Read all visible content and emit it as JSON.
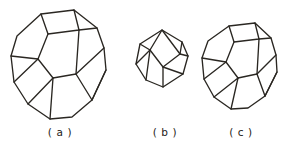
{
  "figure": {
    "background_color": "#ffffff",
    "line_color": "#2a2722",
    "line_width": 1.35,
    "panels": [
      {
        "id": "a",
        "caption": "( a )",
        "shape_name": "truncated-octahedron",
        "relative_size": "large",
        "visible_faces": [
          "square-top",
          "square-center",
          "hexagon-upper-left",
          "hexagon-upper-right",
          "hexagon-left",
          "hexagon-lower-left",
          "hexagon-lower-right",
          "square-right",
          "square-bottom"
        ],
        "outline": [
          [
            41,
            14
          ],
          [
            74,
            10
          ],
          [
            97,
            28
          ],
          [
            104,
            48
          ],
          [
            106,
            70
          ],
          [
            92,
            100
          ],
          [
            72,
            117
          ],
          [
            50,
            119
          ],
          [
            28,
            104
          ],
          [
            14,
            82
          ],
          [
            11,
            56
          ],
          [
            17,
            36
          ],
          [
            28,
            22
          ]
        ],
        "interior_edges": [
          [
            [
              41,
              14
            ],
            [
              48,
              34
            ],
            [
              79,
              30
            ],
            [
              74,
              10
            ]
          ],
          [
            [
              48,
              34
            ],
            [
              38,
              59
            ],
            [
              53,
              78
            ],
            [
              76,
              74
            ],
            [
              79,
              30
            ]
          ],
          [
            [
              79,
              30
            ],
            [
              97,
              28
            ]
          ],
          [
            [
              38,
              59
            ],
            [
              14,
              82
            ]
          ],
          [
            [
              53,
              78
            ],
            [
              50,
              119
            ]
          ],
          [
            [
              76,
              74
            ],
            [
              92,
              100
            ]
          ],
          [
            [
              38,
              59
            ],
            [
              11,
              56
            ]
          ],
          [
            [
              76,
              74
            ],
            [
              104,
              48
            ]
          ],
          [
            [
              106,
              70
            ],
            [
              92,
              100
            ]
          ],
          [
            [
              28,
              104
            ],
            [
              53,
              78
            ]
          ]
        ]
      },
      {
        "id": "b",
        "caption": "( b )",
        "shape_name": "rhombic-polyhedron",
        "relative_size": "small",
        "visible_faces": [
          "rhombus-front",
          "rhombus-upper-left",
          "rhombus-lower-left",
          "rhombus-right",
          "rhombus-top"
        ],
        "outline": [
          [
            162,
            30
          ],
          [
            182,
            42
          ],
          [
            188,
            56
          ],
          [
            183,
            74
          ],
          [
            163,
            87
          ],
          [
            146,
            80
          ],
          [
            136,
            64
          ],
          [
            140,
            44
          ]
        ],
        "interior_edges": [
          [
            [
              162,
              30
            ],
            [
              150,
              50
            ],
            [
              163,
              67
            ],
            [
              180,
              54
            ],
            [
              162,
              30
            ]
          ],
          [
            [
              150,
              50
            ],
            [
              140,
              44
            ]
          ],
          [
            [
              150,
              50
            ],
            [
              146,
              80
            ]
          ],
          [
            [
              163,
              67
            ],
            [
              163,
              87
            ]
          ],
          [
            [
              180,
              54
            ],
            [
              188,
              56
            ]
          ],
          [
            [
              180,
              54
            ],
            [
              182,
              42
            ]
          ],
          [
            [
              136,
              64
            ],
            [
              150,
              50
            ]
          ],
          [
            [
              183,
              74
            ],
            [
              163,
              67
            ]
          ]
        ]
      },
      {
        "id": "c",
        "caption": "( c )",
        "shape_name": "truncated-octahedron",
        "relative_size": "medium",
        "visible_faces": [
          "square-top",
          "square-center",
          "hexagon-upper-left",
          "hexagon-upper-right",
          "hexagon-left",
          "hexagon-lower-left",
          "hexagon-lower-right",
          "square-right",
          "square-bottom"
        ],
        "outline": [
          [
            229,
            26
          ],
          [
            255,
            23
          ],
          [
            271,
            38
          ],
          [
            276,
            55
          ],
          [
            277,
            72
          ],
          [
            265,
            96
          ],
          [
            248,
            108
          ],
          [
            231,
            109
          ],
          [
            214,
            97
          ],
          [
            204,
            79
          ],
          [
            202,
            58
          ],
          [
            208,
            41
          ],
          [
            217,
            32
          ]
        ],
        "interior_edges": [
          [
            [
              229,
              26
            ],
            [
              234,
              42
            ],
            [
              259,
              39
            ],
            [
              255,
              23
            ]
          ],
          [
            [
              234,
              42
            ],
            [
              226,
              62
            ],
            [
              238,
              78
            ],
            [
              257,
              74
            ],
            [
              259,
              39
            ]
          ],
          [
            [
              259,
              39
            ],
            [
              271,
              38
            ]
          ],
          [
            [
              226,
              62
            ],
            [
              204,
              79
            ]
          ],
          [
            [
              238,
              78
            ],
            [
              231,
              109
            ]
          ],
          [
            [
              257,
              74
            ],
            [
              265,
              96
            ]
          ],
          [
            [
              226,
              62
            ],
            [
              202,
              58
            ]
          ],
          [
            [
              257,
              74
            ],
            [
              276,
              55
            ]
          ],
          [
            [
              277,
              72
            ],
            [
              265,
              96
            ]
          ],
          [
            [
              214,
              97
            ],
            [
              238,
              78
            ]
          ]
        ]
      }
    ]
  },
  "captions": {
    "a": "( a )",
    "b": "( b )",
    "c": "( c )"
  }
}
